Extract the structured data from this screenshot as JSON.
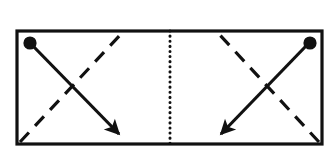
{
  "figure": {
    "kind": "schematic-diagram",
    "background_color": "#ffffff",
    "stroke_color": "#111111",
    "canvas": {
      "width": 331,
      "height": 164
    }
  },
  "frame": {
    "label": "outer-rectangle",
    "x": 17,
    "y": 31,
    "width": 305,
    "height": 113,
    "stroke_width": 3.2,
    "fill": "none"
  },
  "divider": {
    "label": "center-dotted-divider",
    "x": 170,
    "y_top": 31,
    "y_bottom": 144,
    "stroke_width": 3.0,
    "dash_pattern": "0.1 5"
  },
  "panels": [
    {
      "id": "left-panel",
      "label": "left-half",
      "dot": {
        "label": "origin-node",
        "cx": 30,
        "cy": 43,
        "r": 6.6
      },
      "solid_arrow": {
        "label": "solid-arrow-down-right",
        "x1": 33,
        "y1": 46,
        "x2": 119,
        "y2": 134,
        "stroke_width": 3.2,
        "direction": "down-right",
        "arrowhead": "filled-triangle"
      },
      "dashed_line": {
        "label": "dashed-line-up-right",
        "x1": 20,
        "y1": 142,
        "x2": 122,
        "y2": 33,
        "stroke_width": 3.2,
        "dash_pattern": "13 9",
        "direction": "up-right"
      }
    },
    {
      "id": "right-panel",
      "label": "right-half",
      "dot": {
        "label": "origin-node",
        "cx": 310,
        "cy": 43,
        "r": 6.6
      },
      "solid_arrow": {
        "label": "solid-arrow-down-left",
        "x1": 306,
        "y1": 46,
        "x2": 221,
        "y2": 134,
        "stroke_width": 3.2,
        "direction": "down-left",
        "arrowhead": "filled-triangle"
      },
      "dashed_line": {
        "label": "dashed-line-up-left",
        "x1": 319,
        "y1": 142,
        "x2": 218,
        "y2": 33,
        "stroke_width": 3.2,
        "dash_pattern": "13 9",
        "direction": "up-left"
      }
    }
  ]
}
